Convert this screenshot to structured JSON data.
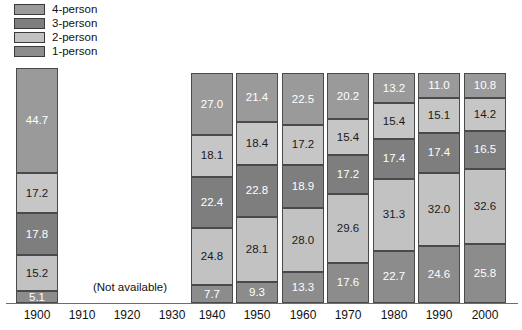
{
  "legend": {
    "items": [
      {
        "label": "4-person",
        "color": "#9a9a9a",
        "icon": "legend-swatch"
      },
      {
        "label": "3-person",
        "color": "#7e7e7e",
        "icon": "legend-swatch"
      },
      {
        "label": "2-person",
        "color": "#c2c2c2",
        "icon": "legend-swatch"
      },
      {
        "label": "1-person",
        "color": "#8c8c8c",
        "icon": "legend-swatch"
      }
    ]
  },
  "annotations": {
    "not_available": "(Not available)"
  },
  "axis": {
    "ticks": [
      "1900",
      "1910",
      "1920",
      "1930",
      "1940",
      "1950",
      "1960",
      "1970",
      "1980",
      "1990",
      "2000"
    ]
  },
  "chart_data": {
    "type": "bar",
    "subtype": "stacked-column",
    "title": "",
    "subtitle": "",
    "xlabel": "",
    "ylabel": "",
    "ylim": [
      0,
      100
    ],
    "grid": false,
    "legend_position": "top-left",
    "stacking": "percent",
    "categories": [
      "1900",
      "1910",
      "1920",
      "1930",
      "1940",
      "1950",
      "1960",
      "1970",
      "1980",
      "1990",
      "2000"
    ],
    "missing_categories": [
      "1910",
      "1920",
      "1930"
    ],
    "stack_order_bottom_to_top": [
      "1-person",
      "2-person",
      "3-person",
      "4-person",
      "5-or-more-person"
    ],
    "series": [
      {
        "name": "1-person",
        "color": "#8c8c8c",
        "text_color": "#ffffff",
        "values": [
          5.1,
          null,
          null,
          null,
          7.7,
          9.3,
          13.3,
          17.6,
          22.7,
          24.6,
          25.8
        ]
      },
      {
        "name": "2-person",
        "color": "#c2c2c2",
        "text_color": "#1a1a1a",
        "values": [
          15.2,
          null,
          null,
          null,
          24.8,
          28.1,
          28.0,
          29.6,
          31.3,
          32.0,
          32.6
        ]
      },
      {
        "name": "3-person",
        "color": "#7e7e7e",
        "text_color": "#ffffff",
        "values": [
          17.8,
          null,
          null,
          null,
          22.4,
          22.8,
          18.9,
          17.2,
          17.4,
          17.4,
          16.5
        ]
      },
      {
        "name": "4-person",
        "color": "#c6c6c6",
        "text_color": "#1a1a1a",
        "values": [
          17.2,
          null,
          null,
          null,
          18.1,
          18.4,
          17.2,
          15.4,
          15.4,
          15.1,
          14.2
        ]
      },
      {
        "name": "5-or-more-person",
        "color": "#9a9a9a",
        "text_color": "#ffffff",
        "values": [
          44.7,
          null,
          null,
          null,
          27.0,
          21.4,
          22.5,
          20.2,
          13.2,
          11.0,
          10.8
        ]
      }
    ]
  },
  "layout": {
    "plot_top_px": 73,
    "plot_bottom_px": 303,
    "bar_1900_top_px": 68,
    "bar_width_px": 42,
    "bar_x_positions": [
      16,
      191,
      236,
      282,
      327,
      373,
      418,
      464
    ]
  }
}
